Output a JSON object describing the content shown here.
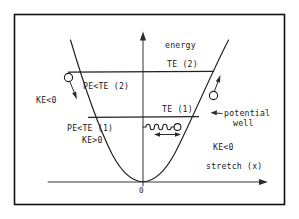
{
  "figure": {
    "background_color": "#ffffff",
    "ink_color": "#1f1f1f",
    "border_color": "#111111"
  },
  "axes": {
    "y_axis_label": "energy",
    "x_axis_label": "stretch (x)",
    "origin_label": "0"
  },
  "energy_levels": [
    {
      "id": "te2",
      "label": "TE (2)"
    },
    {
      "id": "te1",
      "label": "TE (1)"
    }
  ],
  "region_labels": [
    {
      "id": "ke-left",
      "text": "KE<0"
    },
    {
      "id": "pe-te2",
      "text": "PE<TE (2)"
    },
    {
      "id": "pe-te1",
      "text": "PE<TE (1)"
    },
    {
      "id": "ke-positive",
      "text": "KE>0"
    },
    {
      "id": "ke-right",
      "text": "KE<0"
    }
  ],
  "annotations": [
    {
      "id": "potential-well",
      "line1": "potential",
      "line2": "well"
    }
  ],
  "icons": {
    "ball_left": "ball-icon",
    "ball_right": "ball-icon",
    "arrow_down": "arrow-down-icon",
    "arrow_up": "arrow-up-icon",
    "spring": "spring-icon",
    "oscillation_arrow": "double-arrow-horizontal-icon",
    "leader_arrow": "leader-arrow-icon",
    "y_axis_arrow": "arrow-up-icon",
    "x_axis_arrow": "arrow-right-icon"
  }
}
